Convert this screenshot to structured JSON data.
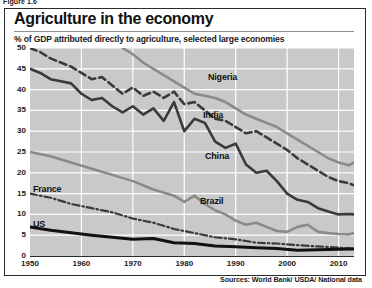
{
  "figure": {
    "caption": "Figure 1.6"
  },
  "header": {
    "title": "Agriculture in the economy",
    "subtitle": "% of GDP attributed directly to agriculture, selected large economies"
  },
  "footer": {
    "source": "Sources: World Bank/ USDA/ National data"
  },
  "axis": {
    "y_ticks": [
      "50",
      "45",
      "40",
      "35",
      "30",
      "25",
      "20",
      "15",
      "10",
      "5",
      "0"
    ],
    "x_ticks": [
      "1950",
      "1960",
      "1970",
      "1980",
      "1990",
      "2000",
      "2010"
    ]
  },
  "series_labels": {
    "nigeria": "Nigeria",
    "india": "India",
    "china": "China",
    "brazil": "Brazil",
    "france": "France",
    "us": "US"
  },
  "colors": {
    "plot_background": "#c9c9c9",
    "gridline": "#ffffff",
    "dark_line": "#3a3a3a",
    "gray_line": "#8a8a8a",
    "black_line": "#111111",
    "panel_border": "#2b2b2b",
    "text": "#1a1a1a"
  },
  "chart_data": {
    "type": "line",
    "title": "Agriculture in the economy",
    "subtitle": "% of GDP attributed directly to agriculture, selected large economies",
    "xlabel": "",
    "ylabel": "% of GDP",
    "xlim": [
      1950,
      2013
    ],
    "ylim": [
      0,
      50
    ],
    "y_ticks": [
      0,
      5,
      10,
      15,
      20,
      25,
      30,
      35,
      40,
      45,
      50
    ],
    "x_ticks": [
      1950,
      1960,
      1970,
      1980,
      1990,
      2000,
      2010
    ],
    "grid": true,
    "legend": "inline-labels",
    "series": [
      {
        "name": "Nigeria",
        "style": "solid",
        "color": "#8a8a8a",
        "width": 2.6,
        "x": [
          1968,
          1970,
          1972,
          1974,
          1976,
          1978,
          1980,
          1982,
          1984,
          1986,
          1988,
          1990,
          1992,
          1994,
          1996,
          1998,
          2000,
          2002,
          2004,
          2006,
          2008,
          2010,
          2012,
          2013
        ],
        "y": [
          50.0,
          48.5,
          46.5,
          45.0,
          43.5,
          42.0,
          40.5,
          39.0,
          38.5,
          38.0,
          37.0,
          35.5,
          34.0,
          33.0,
          32.0,
          31.0,
          29.5,
          28.0,
          26.5,
          25.0,
          23.5,
          22.5,
          21.8,
          22.5
        ]
      },
      {
        "name": "India",
        "style": "dashed",
        "color": "#3a3a3a",
        "width": 2.6,
        "x": [
          1950,
          1952,
          1954,
          1956,
          1958,
          1960,
          1962,
          1964,
          1966,
          1968,
          1970,
          1972,
          1974,
          1976,
          1978,
          1980,
          1982,
          1984,
          1986,
          1988,
          1990,
          1992,
          1994,
          1996,
          1998,
          2000,
          2002,
          2004,
          2006,
          2008,
          2010,
          2012,
          2013
        ],
        "y": [
          50.0,
          49.0,
          47.5,
          46.5,
          45.5,
          44.0,
          42.5,
          43.0,
          41.0,
          39.0,
          40.5,
          38.5,
          39.5,
          38.0,
          39.5,
          36.5,
          37.0,
          35.0,
          33.0,
          32.5,
          31.0,
          29.5,
          30.0,
          28.5,
          27.0,
          25.5,
          23.5,
          22.0,
          20.5,
          19.0,
          18.0,
          17.5,
          17.0
        ]
      },
      {
        "name": "China",
        "style": "solid",
        "color": "#3a3a3a",
        "width": 2.6,
        "x": [
          1950,
          1952,
          1954,
          1956,
          1958,
          1960,
          1962,
          1964,
          1966,
          1968,
          1970,
          1972,
          1974,
          1976,
          1978,
          1980,
          1982,
          1984,
          1986,
          1988,
          1990,
          1992,
          1994,
          1996,
          1998,
          2000,
          2002,
          2004,
          2006,
          2008,
          2010,
          2012,
          2013
        ],
        "y": [
          45.0,
          44.0,
          42.5,
          42.0,
          41.5,
          39.0,
          37.5,
          38.0,
          36.0,
          34.5,
          36.0,
          34.0,
          35.5,
          32.5,
          37.0,
          30.0,
          33.0,
          32.0,
          27.5,
          26.0,
          27.0,
          22.0,
          20.0,
          20.5,
          18.0,
          15.0,
          13.5,
          13.0,
          11.5,
          10.7,
          10.0,
          10.1,
          10.0
        ]
      },
      {
        "name": "Brazil",
        "style": "solid",
        "color": "#8a8a8a",
        "width": 2.6,
        "x": [
          1950,
          1954,
          1958,
          1962,
          1966,
          1970,
          1974,
          1978,
          1980,
          1982,
          1984,
          1986,
          1988,
          1990,
          1992,
          1994,
          1996,
          1998,
          2000,
          2002,
          2004,
          2006,
          2008,
          2010,
          2012,
          2013
        ],
        "y": [
          25.0,
          24.0,
          22.5,
          21.0,
          19.5,
          18.0,
          16.0,
          14.5,
          13.0,
          14.5,
          12.5,
          11.0,
          10.0,
          8.5,
          7.5,
          8.0,
          7.0,
          6.0,
          5.8,
          7.0,
          7.5,
          5.8,
          5.5,
          5.3,
          5.2,
          5.5
        ]
      },
      {
        "name": "France",
        "style": "dash-dot",
        "color": "#3a3a3a",
        "width": 2.2,
        "x": [
          1950,
          1954,
          1958,
          1962,
          1966,
          1970,
          1974,
          1978,
          1982,
          1986,
          1990,
          1994,
          1998,
          2002,
          2006,
          2010,
          2013
        ],
        "y": [
          15.0,
          14.0,
          12.5,
          11.5,
          10.5,
          9.0,
          8.0,
          6.5,
          5.5,
          4.5,
          4.0,
          3.2,
          3.0,
          2.6,
          2.3,
          2.0,
          1.8
        ]
      },
      {
        "name": "US",
        "style": "solid",
        "color": "#111111",
        "width": 3.0,
        "x": [
          1950,
          1954,
          1958,
          1962,
          1966,
          1970,
          1974,
          1978,
          1982,
          1986,
          1990,
          1994,
          1998,
          2002,
          2006,
          2010,
          2013
        ],
        "y": [
          7.0,
          6.2,
          5.6,
          5.0,
          4.5,
          4.0,
          4.2,
          3.2,
          3.0,
          2.4,
          2.2,
          2.0,
          1.8,
          1.4,
          1.5,
          1.6,
          1.7
        ]
      }
    ]
  }
}
